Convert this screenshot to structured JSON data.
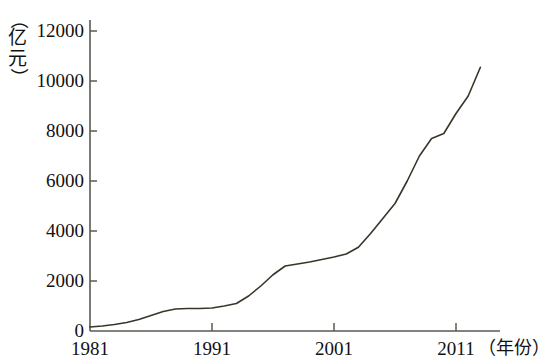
{
  "chart_data": {
    "type": "line",
    "title": "",
    "xlabel": "（年份）",
    "ylabel": "（亿元）",
    "ylabel_chars": [
      "（",
      "亿",
      "元",
      "）"
    ],
    "xlabel_chars": [
      "（",
      "年",
      "份",
      "）"
    ],
    "x_tick_labels": [
      "1981",
      "1991",
      "2001",
      "2011"
    ],
    "x_tick_values": [
      1981,
      1991,
      2001,
      2011
    ],
    "y_tick_labels": [
      "0",
      "2000",
      "4000",
      "6000",
      "8000",
      "10000",
      "12000"
    ],
    "y_tick_values": [
      0,
      2000,
      4000,
      6000,
      8000,
      10000,
      12000
    ],
    "xlim": [
      1981,
      2014
    ],
    "ylim": [
      0,
      12000
    ],
    "grid": false,
    "legend": null,
    "line_color": "#3b3429",
    "axis_color": "#5a5a52",
    "x": [
      1981,
      1982,
      1983,
      1984,
      1985,
      1986,
      1987,
      1988,
      1989,
      1990,
      1991,
      1992,
      1993,
      1994,
      1995,
      1996,
      1997,
      1998,
      1999,
      2000,
      2001,
      2002,
      2003,
      2004,
      2005,
      2006,
      2007,
      2008,
      2009,
      2010,
      2011,
      2012,
      2013
    ],
    "values": [
      160,
      200,
      260,
      340,
      460,
      620,
      780,
      880,
      900,
      900,
      920,
      1000,
      1100,
      1400,
      1800,
      2250,
      2600,
      2680,
      2760,
      2860,
      2960,
      3080,
      3350,
      3900,
      4500,
      5100,
      6000,
      7000,
      7700,
      7900,
      8700,
      9400,
      10550
    ]
  }
}
